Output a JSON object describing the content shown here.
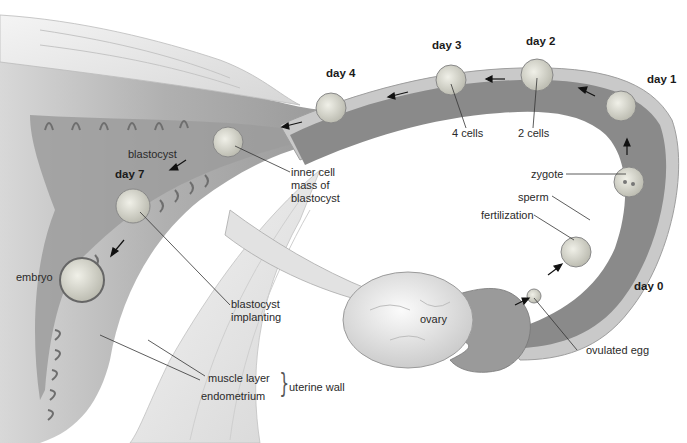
{
  "figure": {
    "colors": {
      "tube_lumen": "#8a8a8a",
      "tube_wall": "#c9c9c9",
      "uterus_tissue": "#b5b5b5",
      "muscle": "#ececec",
      "ovary": "#e6e6e6",
      "cell": "#dcdcd0",
      "label_text": "#2a2a2a",
      "leader_line": "#333333"
    }
  },
  "days": {
    "day0": "day 0",
    "day1": "day 1",
    "day2": "day 2",
    "day3": "day 3",
    "day4": "day 4",
    "day7": "day 7"
  },
  "labels": {
    "zygote": "zygote",
    "sperm": "sperm",
    "fertilization": "fertilization",
    "ovulated_egg": "ovulated egg",
    "ovary": "ovary",
    "two_cells": "2 cells",
    "four_cells": "4 cells",
    "inner_cell_mass": "inner cell\nmass of\nblastocyst",
    "blastocyst": "blastocyst",
    "blastocyst_implanting": "blastocyst\nimplanting",
    "embryo": "embryo",
    "muscle_layer": "muscle layer",
    "endometrium": "endometrium",
    "uterine_wall": "uterine wall"
  }
}
